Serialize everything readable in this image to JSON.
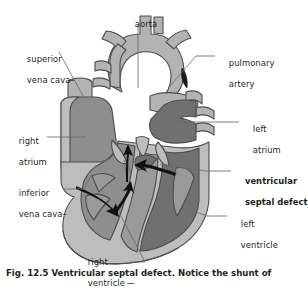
{
  "figure": {
    "type": "anatomical-illustration",
    "caption": "Fig. 12.5 Ventricular septal defect. Notice the shunt of",
    "palette": {
      "background": "#ffffff",
      "outline": "#4d4d4d",
      "vessel_light": "#b3b3b3",
      "chamber_light": "#bdbdbd",
      "chamber_mid": "#8e8e8e",
      "chamber_dark": "#707070",
      "muscle": "#9a9a9a",
      "arrow": "#111111",
      "leader": "#6b6b6b",
      "text": "#231f20"
    }
  },
  "labels": {
    "aorta": "aorta",
    "superior_vena_cava_line1": "superior",
    "superior_vena_cava_line2": "vena cava",
    "pulmonary_artery_line1": "pulmonary",
    "pulmonary_artery_line2": "artery",
    "right_atrium_line1": "right",
    "right_atrium_line2": "atrium",
    "left_atrium_line1": "left",
    "left_atrium_line2": "atrium",
    "inferior_vena_cava_line1": "inferior",
    "inferior_vena_cava_line2": "vena cava",
    "ventricular_septal_defect_line1": "ventricular",
    "ventricular_septal_defect_line2": "septal defect",
    "left_ventricle_line1": "left",
    "left_ventricle_line2": "ventricle",
    "right_ventricle_line1": "right",
    "right_ventricle_line2": "ventricle"
  }
}
